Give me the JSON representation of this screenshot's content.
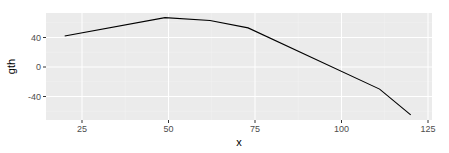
{
  "chart_data": {
    "type": "line",
    "title": "",
    "xlabel": "x",
    "ylabel": "gth",
    "xlim": [
      15,
      126
    ],
    "ylim": [
      -72,
      72
    ],
    "x_ticks": [
      25,
      50,
      75,
      100,
      125
    ],
    "y_ticks": [
      -40,
      0,
      40
    ],
    "grid": true,
    "legend": "none",
    "series": [
      {
        "name": "gth",
        "x": [
          20,
          49,
          62,
          73,
          111,
          120
        ],
        "y": [
          42,
          67,
          63,
          53,
          -30,
          -65
        ],
        "color": "#000000"
      }
    ]
  },
  "theme": {
    "panel_bg": "#ebebeb",
    "grid_major": "#ffffff",
    "grid_minor": "#f5f5f5",
    "tick_color": "#333333"
  }
}
